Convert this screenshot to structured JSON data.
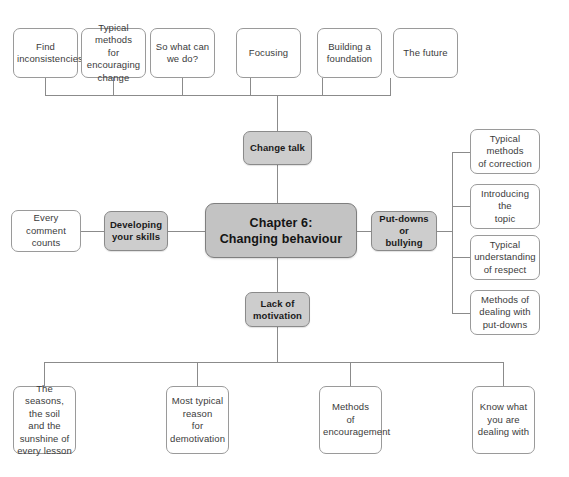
{
  "diagram": {
    "colors": {
      "center_fill": "#c3c3c3",
      "branch_fill": "#cdcdcd",
      "leaf_fill": "#ffffff",
      "line": "#8b8b8b",
      "border": "#9a9a9a",
      "text": "#3b3b3b"
    },
    "center": {
      "line1": "Chapter 6:",
      "line2": "Changing behaviour"
    },
    "branches": {
      "change_talk": "Change talk",
      "developing_your_skills": "Developing\nyour skills",
      "put_downs_or_bullying": "Put-downs or\nbullying",
      "lack_of_motivation": "Lack of\nmotivation"
    },
    "top_leaves": [
      {
        "label": "Find\ninconsistencies"
      },
      {
        "label": "Typical methods\nfor encouraging\nchange"
      },
      {
        "label": "So what can\nwe do?"
      },
      {
        "label": "Focusing"
      },
      {
        "label": "Building a\nfoundation"
      },
      {
        "label": "The future"
      }
    ],
    "left_leaves": [
      {
        "label": "Every comment\ncounts"
      }
    ],
    "right_leaves": [
      {
        "label": "Typical methods\nof correction"
      },
      {
        "label": "Introducing the\ntopic"
      },
      {
        "label": "Typical\nunderstanding\nof respect"
      },
      {
        "label": "Methods of\ndealing with\nput-downs"
      }
    ],
    "bottom_leaves": [
      {
        "label": "The seasons,\nthe soil\nand the\nsunshine of\nevery lesson"
      },
      {
        "label": "Most typical\nreason\nfor\ndemotivation"
      },
      {
        "label": "Methods\nof\nencouragement"
      },
      {
        "label": "Know what\nyou are\ndealing with"
      }
    ]
  }
}
